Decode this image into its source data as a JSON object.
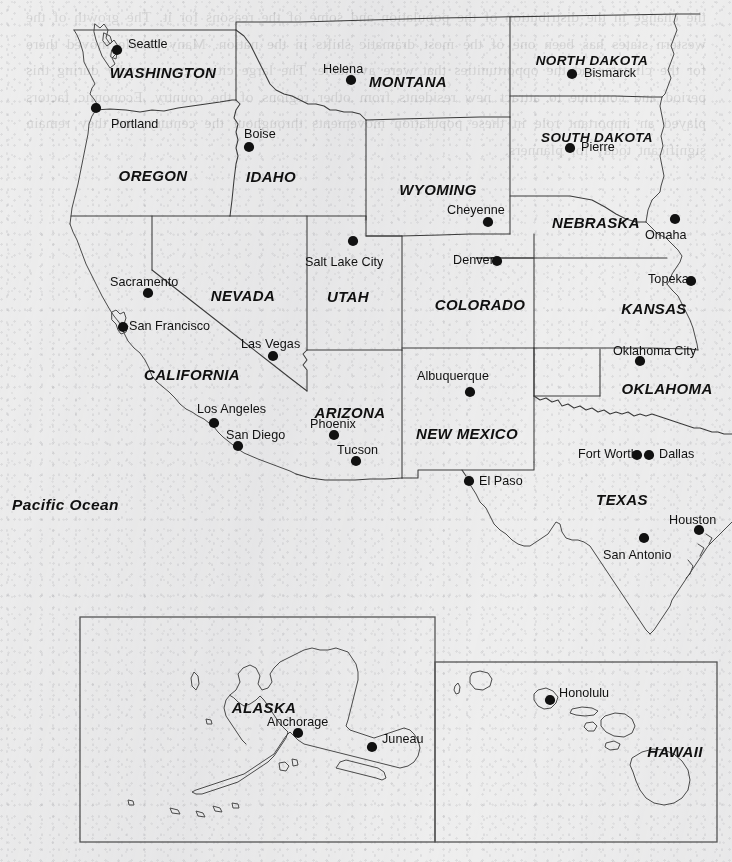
{
  "map": {
    "title": "Western United States",
    "background_color": "#eeeeee",
    "ink_color": "#3a3a3a",
    "width": 732,
    "height": 862,
    "ghost_text": "the change in the distribution of the population and some of the reasons for it. The growth of the western states has been one of the most dramatic shifts in the nation. Many people moved there for the climate and the opportunities that were available. The large cities grew rapidly during this period and continue to attract new residents from other regions of the country. Economic factors played an important role in these population movements throughout the century and they remain significant today for planners.",
    "ocean_label": "Pacific Ocean",
    "states": [
      {
        "name": "WASHINGTON",
        "x": 163,
        "y": 64
      },
      {
        "name": "OREGON",
        "x": 153,
        "y": 167
      },
      {
        "name": "IDAHO",
        "x": 271,
        "y": 168
      },
      {
        "name": "MONTANA",
        "x": 408,
        "y": 73
      },
      {
        "name": "NORTH DAKOTA",
        "x": 592,
        "y": 53
      },
      {
        "name": "SOUTH DAKOTA",
        "x": 597,
        "y": 130
      },
      {
        "name": "NEBRASKA",
        "x": 596,
        "y": 214
      },
      {
        "name": "WYOMING",
        "x": 438,
        "y": 181
      },
      {
        "name": "NEVADA",
        "x": 243,
        "y": 287
      },
      {
        "name": "UTAH",
        "x": 348,
        "y": 288
      },
      {
        "name": "COLORADO",
        "x": 480,
        "y": 296
      },
      {
        "name": "KANSAS",
        "x": 654,
        "y": 300
      },
      {
        "name": "CALIFORNIA",
        "x": 192,
        "y": 366
      },
      {
        "name": "ARIZONA",
        "x": 350,
        "y": 404
      },
      {
        "name": "NEW MEXICO",
        "x": 467,
        "y": 425
      },
      {
        "name": "OKLAHOMA",
        "x": 667,
        "y": 380
      },
      {
        "name": "TEXAS",
        "x": 622,
        "y": 491
      },
      {
        "name": "ALASKA",
        "x": 264,
        "y": 699
      },
      {
        "name": "HAWAII",
        "x": 675,
        "y": 743
      }
    ],
    "cities": [
      {
        "name": "Seattle",
        "dot_x": 117,
        "dot_y": 50,
        "label_x": 128,
        "label_y": 37,
        "align": "left"
      },
      {
        "name": "Portland",
        "dot_x": 96,
        "dot_y": 108,
        "label_x": 111,
        "label_y": 117,
        "align": "left"
      },
      {
        "name": "Boise",
        "dot_x": 249,
        "dot_y": 147,
        "label_x": 244,
        "label_y": 127,
        "align": "left"
      },
      {
        "name": "Helena",
        "dot_x": 351,
        "dot_y": 80,
        "label_x": 323,
        "label_y": 62,
        "align": "left"
      },
      {
        "name": "Bismarck",
        "dot_x": 572,
        "dot_y": 74,
        "label_x": 584,
        "label_y": 66,
        "align": "left"
      },
      {
        "name": "Pierre",
        "dot_x": 570,
        "dot_y": 148,
        "label_x": 581,
        "label_y": 140,
        "align": "left"
      },
      {
        "name": "Cheyenne",
        "dot_x": 488,
        "dot_y": 222,
        "label_x": 447,
        "label_y": 203,
        "align": "left"
      },
      {
        "name": "Omaha",
        "dot_x": 675,
        "dot_y": 219,
        "label_x": 645,
        "label_y": 228,
        "align": "left"
      },
      {
        "name": "Topeka",
        "dot_x": 691,
        "dot_y": 281,
        "label_x": 648,
        "label_y": 272,
        "align": "left"
      },
      {
        "name": "Salt Lake City",
        "dot_x": 353,
        "dot_y": 241,
        "label_x": 305,
        "label_y": 255,
        "align": "left"
      },
      {
        "name": "Denver",
        "dot_x": 497,
        "dot_y": 261,
        "label_x": 453,
        "label_y": 253,
        "align": "left"
      },
      {
        "name": "Sacramento",
        "dot_x": 148,
        "dot_y": 293,
        "label_x": 110,
        "label_y": 275,
        "align": "left"
      },
      {
        "name": "San Francisco",
        "dot_x": 123,
        "dot_y": 327,
        "label_x": 129,
        "label_y": 319,
        "align": "left"
      },
      {
        "name": "Las Vegas",
        "dot_x": 273,
        "dot_y": 356,
        "label_x": 241,
        "label_y": 337,
        "align": "left"
      },
      {
        "name": "Los Angeles",
        "dot_x": 214,
        "dot_y": 423,
        "label_x": 197,
        "label_y": 402,
        "align": "left"
      },
      {
        "name": "San Diego",
        "dot_x": 238,
        "dot_y": 446,
        "label_x": 226,
        "label_y": 428,
        "align": "left"
      },
      {
        "name": "Phoenix",
        "dot_x": 334,
        "dot_y": 435,
        "label_x": 310,
        "label_y": 417,
        "align": "left"
      },
      {
        "name": "Tucson",
        "dot_x": 356,
        "dot_y": 461,
        "label_x": 337,
        "label_y": 443,
        "align": "left"
      },
      {
        "name": "Albuquerque",
        "dot_x": 470,
        "dot_y": 392,
        "label_x": 417,
        "label_y": 369,
        "align": "left"
      },
      {
        "name": "El Paso",
        "dot_x": 469,
        "dot_y": 481,
        "label_x": 479,
        "label_y": 474,
        "align": "left"
      },
      {
        "name": "Oklahoma City",
        "dot_x": 640,
        "dot_y": 361,
        "label_x": 613,
        "label_y": 344,
        "align": "left"
      },
      {
        "name": "Fort Worth",
        "dot_x": 637,
        "dot_y": 455,
        "label_x": 578,
        "label_y": 447,
        "align": "left"
      },
      {
        "name": "Dallas",
        "dot_x": 649,
        "dot_y": 455,
        "label_x": 659,
        "label_y": 447,
        "align": "left"
      },
      {
        "name": "Houston",
        "dot_x": 699,
        "dot_y": 530,
        "label_x": 669,
        "label_y": 513,
        "align": "left"
      },
      {
        "name": "San Antonio",
        "dot_x": 644,
        "dot_y": 538,
        "label_x": 603,
        "label_y": 548,
        "align": "left"
      },
      {
        "name": "Anchorage",
        "dot_x": 298,
        "dot_y": 733,
        "label_x": 267,
        "label_y": 715,
        "align": "left"
      },
      {
        "name": "Juneau",
        "dot_x": 372,
        "dot_y": 747,
        "label_x": 382,
        "label_y": 732,
        "align": "left"
      },
      {
        "name": "Honolulu",
        "dot_x": 550,
        "dot_y": 700,
        "label_x": 559,
        "label_y": 686,
        "align": "left"
      }
    ],
    "insets": [
      {
        "name": "alaska-inset",
        "x": 80,
        "y": 617,
        "width": 355,
        "height": 225
      },
      {
        "name": "hawaii-inset",
        "x": 435,
        "y": 662,
        "width": 282,
        "height": 180
      }
    ]
  }
}
